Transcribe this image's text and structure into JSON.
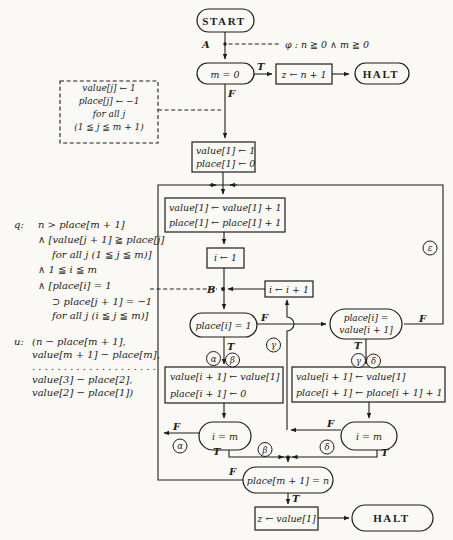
{
  "colors": {
    "paper": "#faf9f5",
    "ink": "#1f1c18"
  },
  "fc": {
    "start": "START",
    "halt": "HALT",
    "a": "A",
    "b": "B",
    "t": "T",
    "f": "F",
    "phi": "φ : n ≧ 0 ∧ m ≧ 0",
    "test_m_zero": "m = 0",
    "set_z_n": "z ← n + 1",
    "note1": "value[j] ← 1",
    "note2": "place[j] ← −1",
    "note3": "for all j",
    "note4": "(1 ≦ j ≦ m + 1)",
    "init1": "value[1] ← 1",
    "init2": "place[1] ← 0",
    "bump1": "value[1] ← value[1] + 1",
    "bump2": "place[1] ← place[1] + 1",
    "seti": "i ← 1",
    "inci": "i ← i + 1",
    "test_place": "place[i] = 1",
    "left1": "value[i + 1] ← value[1]",
    "left2": "place[i + 1] ← 0",
    "im": "i = m",
    "test_pv1": "place[i] =",
    "test_pv2": "value[i + 1]",
    "right1": "value[i + 1] ← value[1]",
    "right2": "place[i + 1] ← place[i + 1] + 1",
    "test_final": "place[m + 1] = n",
    "set_z_value": "z ← value[1]",
    "alpha": "α",
    "beta": "β",
    "gamma": "γ",
    "delta": "δ",
    "epsilon": "ε"
  },
  "ann": {
    "q_label": "q:",
    "q_lines": [
      "n > place[m + 1]",
      "∧ [value[j + 1] ≧ place[j]",
      "for all j (1 ≦ j ≦ m)]",
      "∧ 1 ≦ i ≦ m",
      "∧ [place[i] = 1",
      "⊃ place[j + 1] = −1",
      "for all j (i ≦ j ≦ m)]"
    ],
    "u_label": "u:",
    "u_lines": [
      "(n − place[m + 1],",
      "value[m + 1] − place[m],",
      ". . . . . . . . . . . . . . . . . . . .",
      "value[3] − place[2],",
      "value[2] − place[1])"
    ]
  }
}
